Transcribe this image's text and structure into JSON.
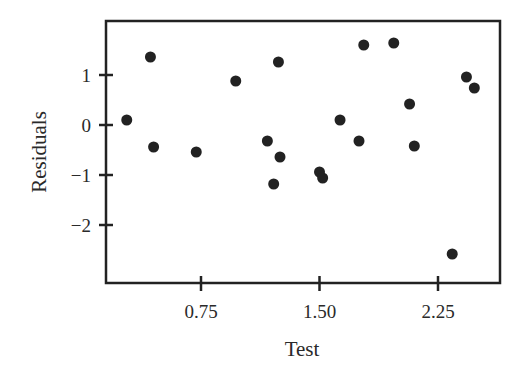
{
  "chart_data": {
    "type": "scatter",
    "title": "",
    "xlabel": "Test",
    "ylabel": "Residuals",
    "xlim": [
      0.15,
      2.55
    ],
    "ylim": [
      -3.15,
      2.1
    ],
    "x_ticks": [
      0.75,
      1.5,
      2.25
    ],
    "x_tick_labels": [
      "0.75",
      "1.50",
      "2.25"
    ],
    "y_ticks": [
      1,
      0,
      -1,
      -2
    ],
    "y_tick_labels": [
      "1",
      "0",
      "−1",
      "−2"
    ],
    "grid": false,
    "legend": null,
    "marker_color": "#222222",
    "points": [
      {
        "x": 0.28,
        "y": 0.1
      },
      {
        "x": 0.43,
        "y": 1.36
      },
      {
        "x": 0.45,
        "y": -0.44
      },
      {
        "x": 0.72,
        "y": -0.54
      },
      {
        "x": 0.97,
        "y": 0.88
      },
      {
        "x": 1.17,
        "y": -0.32
      },
      {
        "x": 1.24,
        "y": 1.26
      },
      {
        "x": 1.25,
        "y": -0.64
      },
      {
        "x": 1.21,
        "y": -1.18
      },
      {
        "x": 1.5,
        "y": -0.94
      },
      {
        "x": 1.52,
        "y": -1.06
      },
      {
        "x": 1.63,
        "y": 0.1
      },
      {
        "x": 1.75,
        "y": -0.32
      },
      {
        "x": 1.78,
        "y": 1.6
      },
      {
        "x": 1.97,
        "y": 1.64
      },
      {
        "x": 2.07,
        "y": 0.42
      },
      {
        "x": 2.1,
        "y": -0.42
      },
      {
        "x": 2.34,
        "y": -2.58
      },
      {
        "x": 2.43,
        "y": 0.96
      },
      {
        "x": 2.48,
        "y": 0.74
      }
    ]
  }
}
